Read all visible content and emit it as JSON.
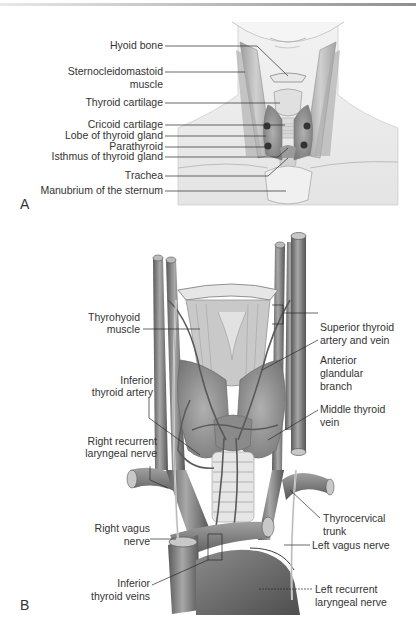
{
  "figure": {
    "panel_a": {
      "letter": "A",
      "labels": [
        {
          "id": "hyoid",
          "text": "Hyoid bone"
        },
        {
          "id": "scm1",
          "text": "Sternocleidomastoid"
        },
        {
          "id": "scm2",
          "text": "muscle"
        },
        {
          "id": "thyroid_cart",
          "text": "Thyroid cartilage"
        },
        {
          "id": "cricoid",
          "text": "Cricoid cartilage"
        },
        {
          "id": "lobe",
          "text": "Lobe of thyroid gland"
        },
        {
          "id": "parathyroid",
          "text": "Parathyroid"
        },
        {
          "id": "isthmus",
          "text": "Isthmus of thyroid gland"
        },
        {
          "id": "trachea",
          "text": "Trachea"
        },
        {
          "id": "manubrium",
          "text": "Manubrium of the sternum"
        }
      ]
    },
    "panel_b": {
      "letter": "B",
      "labels_left": [
        {
          "id": "thyrohyoid1",
          "text": "Thyrohyoid"
        },
        {
          "id": "thyrohyoid2",
          "text": "muscle"
        },
        {
          "id": "inf_art1",
          "text": "Inferior"
        },
        {
          "id": "inf_art2",
          "text": "thyroid artery"
        },
        {
          "id": "rrln1",
          "text": "Right recurrent"
        },
        {
          "id": "rrln2",
          "text": "laryngeal nerve"
        },
        {
          "id": "rvagus1",
          "text": "Right vagus"
        },
        {
          "id": "rvagus2",
          "text": "nerve"
        },
        {
          "id": "inf_vein1",
          "text": "Inferior"
        },
        {
          "id": "inf_vein2",
          "text": "thyroid veins"
        }
      ],
      "labels_right": [
        {
          "id": "sup1",
          "text": "Superior thyroid"
        },
        {
          "id": "sup2",
          "text": "artery and vein"
        },
        {
          "id": "ant1",
          "text": "Anterior"
        },
        {
          "id": "ant2",
          "text": "glandular"
        },
        {
          "id": "ant3",
          "text": "branch"
        },
        {
          "id": "mid1",
          "text": "Middle thyroid"
        },
        {
          "id": "mid2",
          "text": "vein"
        },
        {
          "id": "thyc1",
          "text": "Thyrocervical"
        },
        {
          "id": "thyc2",
          "text": "trunk"
        },
        {
          "id": "lvagus",
          "text": "Left vagus nerve"
        },
        {
          "id": "lrln1",
          "text": "Left recurrent"
        },
        {
          "id": "lrln2",
          "text": "laryngeal nerve"
        }
      ]
    }
  },
  "colors": {
    "text": "#333333",
    "leader": "#2a2a2a",
    "skin": "#ececec",
    "muscle": "#b9b9b9",
    "vessel": "#6e6e6e",
    "vessel_light": "#9a9a9a",
    "gland": "#8c8c8c"
  }
}
